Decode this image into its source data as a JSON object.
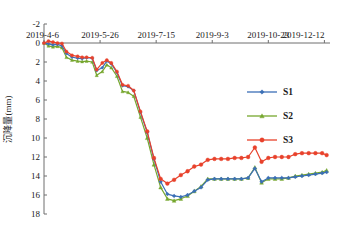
{
  "chart_data": {
    "type": "line",
    "title": "",
    "xlabel": "",
    "ylabel": "沉降量(mm)",
    "ylim": [
      -2,
      18
    ],
    "y_inverted": true,
    "yticks": [
      -2,
      0,
      2,
      4,
      6,
      8,
      10,
      12,
      14,
      16,
      18
    ],
    "ytick_labels": [
      "-2",
      "0",
      "2",
      "4",
      "6",
      "8",
      "10",
      "12",
      "14",
      "16",
      "18"
    ],
    "xtick_labels": [
      "2019-4-6",
      "2019-5-26",
      "2019-7-15",
      "2019-9-3",
      "2019-10-23",
      "2019-12-12"
    ],
    "xtick_days": [
      0,
      50,
      100,
      150,
      200,
      250
    ],
    "xlim_days": [
      0,
      255
    ],
    "grid": false,
    "legend_position": "right",
    "series": [
      {
        "name": "S1",
        "color": "#3B6FB6",
        "marker": "diamond",
        "x": [
          0,
          4,
          8,
          12,
          16,
          20,
          25,
          30,
          34,
          38,
          43,
          47,
          52,
          56,
          60,
          65,
          70,
          75,
          80,
          86,
          92,
          98,
          104,
          110,
          116,
          122,
          128,
          134,
          140,
          146,
          152,
          158,
          164,
          170,
          176,
          182,
          188,
          194,
          200,
          206,
          212,
          218,
          224,
          230,
          236,
          242,
          248,
          252
        ],
        "values": [
          0.0,
          0.1,
          0.2,
          0.15,
          0.3,
          1.1,
          1.5,
          1.6,
          1.65,
          1.55,
          1.6,
          2.9,
          2.6,
          1.9,
          2.2,
          3.1,
          4.5,
          4.6,
          5.0,
          7.3,
          9.4,
          12.2,
          14.6,
          15.9,
          16.1,
          16.2,
          16.0,
          15.6,
          15.2,
          14.4,
          14.3,
          14.3,
          14.3,
          14.3,
          14.3,
          14.2,
          13.2,
          14.6,
          14.2,
          14.2,
          14.2,
          14.2,
          14.1,
          14.0,
          13.9,
          13.8,
          13.7,
          13.6
        ]
      },
      {
        "name": "S2",
        "color": "#76A72E",
        "marker": "triangle",
        "x": [
          0,
          4,
          8,
          12,
          16,
          20,
          25,
          30,
          34,
          38,
          43,
          47,
          52,
          56,
          60,
          65,
          70,
          75,
          80,
          86,
          92,
          98,
          104,
          110,
          116,
          122,
          128,
          134,
          140,
          146,
          152,
          158,
          164,
          170,
          176,
          182,
          188,
          194,
          200,
          206,
          212,
          218,
          224,
          230,
          236,
          242,
          248,
          252
        ],
        "values": [
          0.0,
          0.3,
          0.4,
          0.35,
          0.5,
          1.5,
          1.8,
          1.9,
          1.95,
          1.9,
          2.0,
          3.4,
          3.0,
          2.3,
          2.6,
          3.5,
          5.1,
          5.2,
          5.6,
          7.8,
          10.0,
          12.8,
          15.2,
          16.4,
          16.6,
          16.4,
          16.1,
          15.6,
          15.1,
          14.3,
          14.3,
          14.3,
          14.3,
          14.3,
          14.3,
          14.2,
          13.1,
          14.7,
          14.3,
          14.3,
          14.3,
          14.2,
          14.0,
          13.9,
          13.8,
          13.7,
          13.6,
          13.4
        ]
      },
      {
        "name": "S3",
        "color": "#E8412B",
        "marker": "circle",
        "x": [
          0,
          4,
          8,
          12,
          16,
          20,
          25,
          30,
          34,
          38,
          43,
          47,
          52,
          56,
          60,
          65,
          70,
          75,
          80,
          86,
          92,
          98,
          104,
          110,
          116,
          122,
          128,
          134,
          140,
          146,
          152,
          158,
          164,
          170,
          176,
          182,
          188,
          194,
          200,
          206,
          212,
          218,
          224,
          230,
          236,
          242,
          248,
          252
        ],
        "values": [
          0.0,
          -0.2,
          -0.1,
          0.0,
          0.05,
          0.9,
          1.3,
          1.4,
          1.5,
          1.5,
          1.55,
          2.8,
          2.1,
          1.8,
          2.1,
          3.0,
          4.4,
          4.5,
          5.0,
          7.2,
          9.3,
          12.1,
          14.3,
          14.8,
          14.4,
          13.9,
          13.5,
          13.0,
          12.8,
          12.3,
          12.2,
          12.2,
          12.2,
          12.1,
          12.1,
          12.0,
          11.0,
          12.5,
          12.1,
          12.0,
          12.0,
          12.0,
          11.7,
          11.6,
          11.6,
          11.6,
          11.6,
          11.8
        ]
      }
    ]
  },
  "legend": {
    "entries": [
      {
        "label": "S1"
      },
      {
        "label": "S2"
      },
      {
        "label": "S3"
      }
    ]
  },
  "axes": {
    "y_title": "沉降量(mm)"
  }
}
